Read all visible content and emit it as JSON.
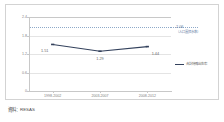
{
  "chart_data": {
    "type": "line",
    "title": "",
    "xlabel": "",
    "ylabel": "",
    "categories": [
      "1998-2002",
      "2003-2007",
      "2008-2012"
    ],
    "values": [
      1.51,
      1.29,
      1.44
    ],
    "point_labels": [
      "1.51",
      "1.29",
      "1.44"
    ],
    "series": [
      {
        "name": "合計特殊出生率",
        "values": [
          1.51,
          1.29,
          1.44
        ],
        "color": "#33415c"
      }
    ],
    "ylim": [
      0,
      2.4
    ],
    "yticks": [
      2.4,
      1.8,
      1.2,
      0.6,
      0
    ],
    "ytick_labels": [
      "2.4",
      "1.8",
      "1.2",
      "0.6",
      "0"
    ],
    "grid": true,
    "legend_position": "right",
    "reference_line": {
      "value": 2.06,
      "label": "2.06",
      "sublabel": "（人口置換水準）",
      "color": "#8ea9c9",
      "style": "dotted"
    }
  },
  "legend": {
    "entries": [
      {
        "label": "合計特殊出生率",
        "color": "#33415c"
      }
    ]
  },
  "source": {
    "text": "資料：RESAS"
  },
  "colors": {
    "series": "#33415c",
    "reference": "#8ea9c9",
    "grid": "#e4e4e4",
    "axis": "#c8c8c8",
    "frame": "#d3d3d3"
  }
}
